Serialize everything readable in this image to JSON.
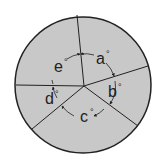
{
  "diagram": {
    "type": "circle divided into five sectors with angle labels",
    "fill_color": "#c8c8c8",
    "stroke_color": "#222222",
    "angles": [
      {
        "id": "a",
        "label": "a",
        "unit": "°"
      },
      {
        "id": "b",
        "label": "b",
        "unit": "°"
      },
      {
        "id": "c",
        "label": "c",
        "unit": "°"
      },
      {
        "id": "d",
        "label": "d",
        "unit": "°"
      },
      {
        "id": "e",
        "label": "e",
        "unit": "°"
      }
    ],
    "degree_symbol": "°"
  }
}
